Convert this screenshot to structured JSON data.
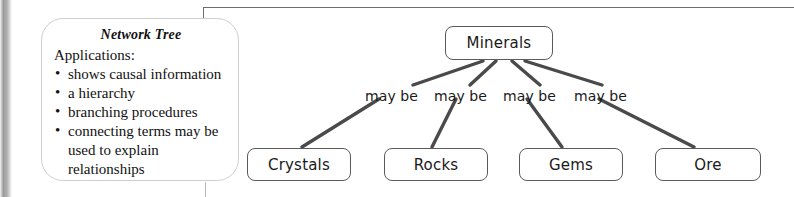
{
  "card": {
    "title": "Network Tree",
    "subtitle": "Applications:",
    "bullet_glyph": "•",
    "items": [
      "shows causal information",
      "a hierarchy",
      "branching procedures",
      "connecting terms may be used to explain relationships"
    ]
  },
  "diagram": {
    "root": {
      "label": "Minerals",
      "x": 445,
      "y": 26,
      "w": 108,
      "h": 34
    },
    "children": [
      {
        "label": "Crystals",
        "x": 247,
        "y": 148,
        "w": 104,
        "h": 33
      },
      {
        "label": "Rocks",
        "x": 384,
        "y": 148,
        "w": 104,
        "h": 33
      },
      {
        "label": "Gems",
        "x": 519,
        "y": 148,
        "w": 104,
        "h": 33
      },
      {
        "label": "Ore",
        "x": 655,
        "y": 148,
        "w": 106,
        "h": 33
      }
    ],
    "edge_labels": [
      {
        "text": "may be",
        "x": 365,
        "y": 88
      },
      {
        "text": "may be",
        "x": 434,
        "y": 88
      },
      {
        "text": "may be",
        "x": 503,
        "y": 88
      },
      {
        "text": "may be",
        "x": 574,
        "y": 88
      }
    ],
    "upper_edges": [
      {
        "x1": 483,
        "y1": 61,
        "x2": 413,
        "y2": 85
      },
      {
        "x1": 496,
        "y1": 61,
        "x2": 470,
        "y2": 85
      },
      {
        "x1": 512,
        "y1": 61,
        "x2": 540,
        "y2": 85
      },
      {
        "x1": 525,
        "y1": 61,
        "x2": 602,
        "y2": 85
      }
    ],
    "lower_edges": [
      {
        "x1": 379,
        "y1": 99,
        "x2": 302,
        "y2": 147
      },
      {
        "x1": 456,
        "y1": 99,
        "x2": 432,
        "y2": 147
      },
      {
        "x1": 527,
        "y1": 99,
        "x2": 562,
        "y2": 147
      },
      {
        "x1": 599,
        "y1": 99,
        "x2": 694,
        "y2": 147
      }
    ],
    "edge_color": "#4a4a4a",
    "node_border_color": "#5a5a5a"
  }
}
